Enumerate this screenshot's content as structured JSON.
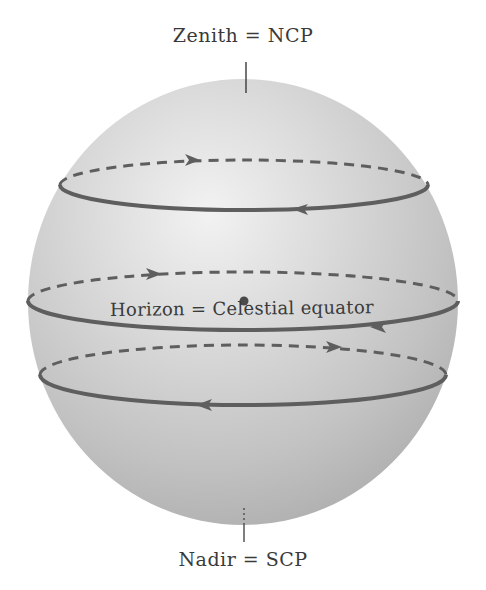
{
  "labels": {
    "zenith": "Zenith = NCP",
    "nadir": "Nadir = SCP",
    "horizon": "Horizon = Celestial equator"
  },
  "colors": {
    "sphere_edge": "#b4b4b4",
    "sphere_mid": "#cfcfcf",
    "sphere_highlight": "#f0f0f0",
    "orbit_stroke": "#5e5e5e",
    "text": "#3a3a3a",
    "background": "#ffffff"
  },
  "sphere": {
    "cx": 243,
    "cy": 302,
    "rx": 215,
    "ry": 223
  },
  "star_paths": [
    {
      "name": "upper-star-path",
      "cx": 244,
      "cy": 185,
      "rx": 184,
      "ry": 25,
      "back_arrow": "right",
      "front_arrow": "left"
    },
    {
      "name": "equator-star-path",
      "cx": 243,
      "cy": 301,
      "rx": 215,
      "ry": 29,
      "back_arrow": "right",
      "front_arrow": "left"
    },
    {
      "name": "lower-star-path",
      "cx": 243,
      "cy": 375,
      "rx": 203,
      "ry": 30,
      "back_arrow": "right",
      "front_arrow": "left"
    }
  ],
  "observer_dot": {
    "cx": 244,
    "cy": 301
  }
}
